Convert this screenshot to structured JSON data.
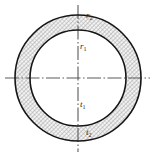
{
  "figure": {
    "name": "annular-cross-section",
    "background_color": "#ffffff",
    "line_color": "#1a1a1a",
    "hatch_color": "#8a8a8a",
    "axis_color": "#555555",
    "hatch_fill_background": "#f2f2f2",
    "geometry": {
      "center_x": 78,
      "center_y": 78,
      "outer_radius": 63,
      "inner_radius": 48,
      "outer_circle_top_y": 22,
      "outer_circle_bottom_y": 134,
      "inner_circle_top_y": 43,
      "inner_circle_bottom_y": 113,
      "outer_circle_left_x": 15,
      "outer_circle_right_x": 141,
      "inner_circle_left_x": 30,
      "inner_circle_right_x": 126,
      "horizontal_axis_y": 78,
      "horizontal_axis_start_x": 5,
      "horizontal_axis_end_x": 150,
      "vertical_axis_x": 78,
      "vertical_axis_start_y": 5,
      "vertical_axis_end_y": 152
    },
    "labels": [
      {
        "id": "r2",
        "base": "r",
        "subscript": "2",
        "meaning": "outer radius",
        "x": 86,
        "y": 11
      },
      {
        "id": "r1",
        "base": "r",
        "subscript": "1",
        "meaning": "inner radius",
        "x": 80,
        "y": 42
      },
      {
        "id": "t1",
        "base": "t",
        "subscript": "1",
        "meaning": "inner boundary thickness marker",
        "x": 80,
        "y": 100
      },
      {
        "id": "t2",
        "base": "t",
        "subscript": "2",
        "meaning": "outer boundary thickness marker",
        "x": 86,
        "y": 128
      }
    ]
  }
}
